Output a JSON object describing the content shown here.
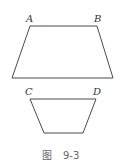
{
  "figure": {
    "caption_prefix": "图",
    "caption_number": "9-3",
    "stroke_color": "#4a4a4a",
    "shapes": [
      {
        "name": "upper-trapezoid",
        "points": [
          [
            30,
            26
          ],
          [
            97,
            26
          ],
          [
            113,
            78
          ],
          [
            12,
            78
          ]
        ],
        "labels": [
          {
            "text": "A",
            "x": 26,
            "y": 22
          },
          {
            "text": "B",
            "x": 94,
            "y": 22
          }
        ]
      },
      {
        "name": "lower-trapezoid",
        "points": [
          [
            30,
            99
          ],
          [
            96,
            99
          ],
          [
            83,
            133
          ],
          [
            44,
            133
          ]
        ],
        "labels": [
          {
            "text": "C",
            "x": 25,
            "y": 95
          },
          {
            "text": "D",
            "x": 93,
            "y": 95
          }
        ]
      }
    ]
  }
}
